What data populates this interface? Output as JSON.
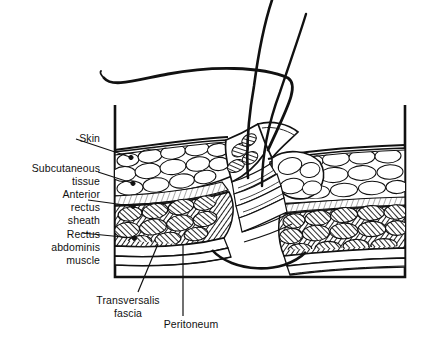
{
  "figure": {
    "kind": "anatomical-line-drawing",
    "stroke_color": "#111111",
    "background_color": "#ffffff",
    "frame": {
      "left": 115,
      "top": 105,
      "right": 405,
      "bottom": 277
    }
  },
  "labels": [
    {
      "id": "skin",
      "text": "Skin"
    },
    {
      "id": "subcutaneous_tissue",
      "text": "Subcutaneous\ntissue"
    },
    {
      "id": "anterior_rectus_sheath",
      "text": "Anterior\nrectus\nsheath"
    },
    {
      "id": "rectus_abdominis_muscle",
      "text": "Rectus\nabdominis\nmuscle"
    },
    {
      "id": "transversalis_fascia",
      "text": "Transversalis\nfascia"
    },
    {
      "id": "peritoneum",
      "text": "Peritoneum"
    }
  ],
  "layers": [
    {
      "name": "skin",
      "position": "outermost surface line"
    },
    {
      "name": "subcutaneous tissue",
      "position": "fat globule layer beneath skin"
    },
    {
      "name": "anterior rectus sheath",
      "position": "thin fibrous sheet above muscle"
    },
    {
      "name": "rectus abdominis muscle",
      "position": "dark hatched muscle bundles"
    },
    {
      "name": "transversalis fascia",
      "position": "thin sheet deep to muscle"
    },
    {
      "name": "peritoneum",
      "position": "innermost lining layer"
    }
  ],
  "suture": {
    "thread_count": 2,
    "description": "Two suture strands rise from the incision and exit the top of the frame; a long curved strand loops over to the left"
  }
}
